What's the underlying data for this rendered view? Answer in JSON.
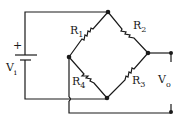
{
  "diagram": {
    "type": "wheatstone-bridge-circuit",
    "source": {
      "label": "V",
      "subscript": "i",
      "polarity": "+"
    },
    "resistors": [
      {
        "label": "R",
        "subscript": "1"
      },
      {
        "label": "R",
        "subscript": "2"
      },
      {
        "label": "R",
        "subscript": "3"
      },
      {
        "label": "R",
        "subscript": "4"
      }
    ],
    "output": {
      "label": "V",
      "subscript": "o"
    }
  }
}
